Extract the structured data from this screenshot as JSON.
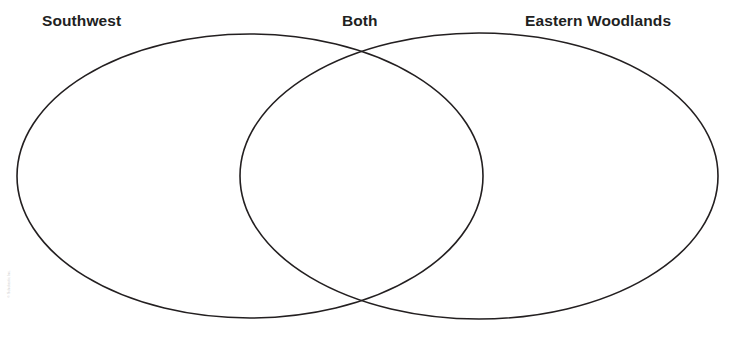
{
  "worksheet": {
    "type": "venn-diagram",
    "background_color": "#ffffff",
    "stroke_color": "#231f20",
    "labels": {
      "left": "Southwest",
      "center": "Both",
      "right": "Eastern Woodlands"
    },
    "credit_line": "© Scholastic Inc.",
    "regions": {
      "left_only_content": "",
      "overlap_content": "",
      "right_only_content": ""
    }
  },
  "geometry": {
    "left_ellipse": {
      "cx": 250,
      "cy": 176,
      "rx": 233,
      "ry": 142
    },
    "right_ellipse": {
      "cx": 479,
      "cy": 176,
      "rx": 239,
      "ry": 143
    },
    "stroke_width": 1.6
  }
}
